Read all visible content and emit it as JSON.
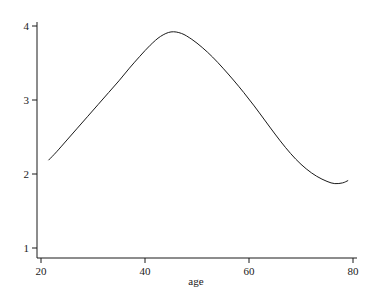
{
  "chart_data": {
    "type": "line",
    "title": "",
    "subtitle": "",
    "xlabel": "age",
    "ylabel": "",
    "xlim": [
      20,
      80
    ],
    "ylim": [
      1,
      4
    ],
    "grid": false,
    "legend": null,
    "legend_position": "none",
    "x_ticks": [
      20,
      40,
      60,
      80
    ],
    "x_tick_labels": [
      "20",
      "40",
      "60",
      "80"
    ],
    "y_ticks": [
      1,
      2,
      3,
      4
    ],
    "y_tick_labels": [
      "1",
      "2",
      "3",
      "4"
    ],
    "line_color": "#1a1a1a",
    "background_color": "#ffffff",
    "series": [
      {
        "name": "smooth",
        "x": [
          21.5,
          23,
          25,
          27,
          29,
          31,
          33,
          35,
          37,
          39,
          41,
          43,
          45,
          47,
          49,
          51,
          53,
          55,
          57,
          59,
          61,
          63,
          65,
          67,
          69,
          71,
          73,
          75,
          76.5,
          78,
          79
        ],
        "y": [
          2.19,
          2.3,
          2.46,
          2.62,
          2.78,
          2.94,
          3.1,
          3.26,
          3.43,
          3.59,
          3.74,
          3.86,
          3.92,
          3.9,
          3.82,
          3.71,
          3.58,
          3.43,
          3.27,
          3.1,
          2.92,
          2.73,
          2.54,
          2.36,
          2.2,
          2.07,
          1.97,
          1.9,
          1.87,
          1.88,
          1.91
        ]
      }
    ],
    "annotations": []
  },
  "axes": {
    "x_axis_name": "x-axis",
    "y_axis_name": "y-axis"
  }
}
